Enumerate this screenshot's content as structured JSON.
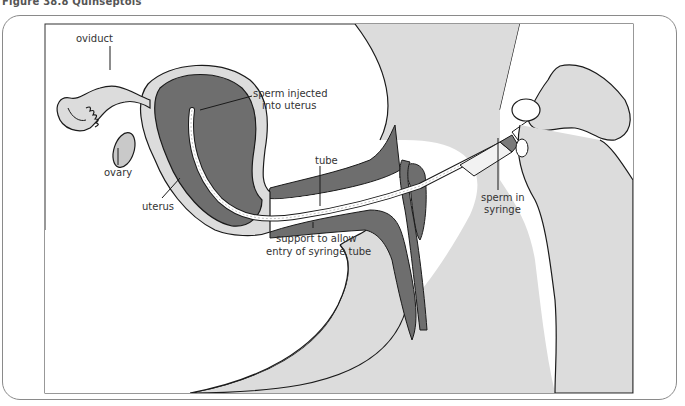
{
  "figure": {
    "caption": "Figure 38.8 Quinseptois",
    "colors": {
      "dark_tissue": "#6e6e6e",
      "light_tissue": "#dcdcdc",
      "outline": "#1a1a1a",
      "frame": "#8a8a8a",
      "background": "#ffffff"
    }
  },
  "labels": {
    "oviduct": "oviduct",
    "ovary": "ovary",
    "uterus": "uterus",
    "sperm_injected_line1": "sperm injected",
    "sperm_injected_line2": "into uterus",
    "tube": "tube",
    "support_line1": "support to allow",
    "support_line2": "entry of syringe tube",
    "sperm_syringe_line1": "sperm in",
    "sperm_syringe_line2": "syringe"
  }
}
